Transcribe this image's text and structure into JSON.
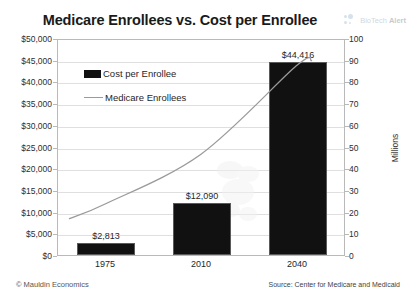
{
  "chart_data": {
    "type": "bar",
    "title": "Medicare Enrollees vs. Cost per Enrollee",
    "xlabel": "",
    "ylabel": "",
    "categories": [
      "1975",
      "2010",
      "2040"
    ],
    "grid": true,
    "legend_position": "top-left",
    "series": [
      {
        "name": "Cost per Enrollee",
        "type": "bar",
        "axis": "left",
        "color": "#111111",
        "values": [
          2813,
          12090,
          44416
        ],
        "data_labels": [
          "$2,813",
          "$12,090",
          "$44,416"
        ]
      },
      {
        "name": "Medicare Enrollees",
        "type": "line",
        "axis": "right",
        "color": "#9a9a9a",
        "values": [
          24,
          47,
          88
        ]
      }
    ],
    "left_axis": {
      "label": "",
      "min": 0,
      "max": 50000,
      "step": 5000,
      "ticks": [
        "$0",
        "$5,000",
        "$10,000",
        "$15,000",
        "$20,000",
        "$25,000",
        "$30,000",
        "$35,000",
        "$40,000",
        "$45,000",
        "$50,000"
      ]
    },
    "right_axis": {
      "label": "Millions",
      "min": 0,
      "max": 100,
      "step": 10,
      "ticks": [
        "0",
        "10",
        "20",
        "30",
        "40",
        "50",
        "60",
        "70",
        "80",
        "90",
        "100"
      ]
    }
  },
  "watermark": {
    "text_light": "BioTech",
    "text_bold": "Alert"
  },
  "footer": {
    "copyright": "© Mauldin Economics",
    "source": "Source: Center for Medicare and Medicaid"
  },
  "colors": {
    "bar": "#111111",
    "line": "#9a9a9a",
    "grid": "#dfdfdf",
    "frame": "#b9b9b9",
    "text": "#1f1f1f"
  }
}
